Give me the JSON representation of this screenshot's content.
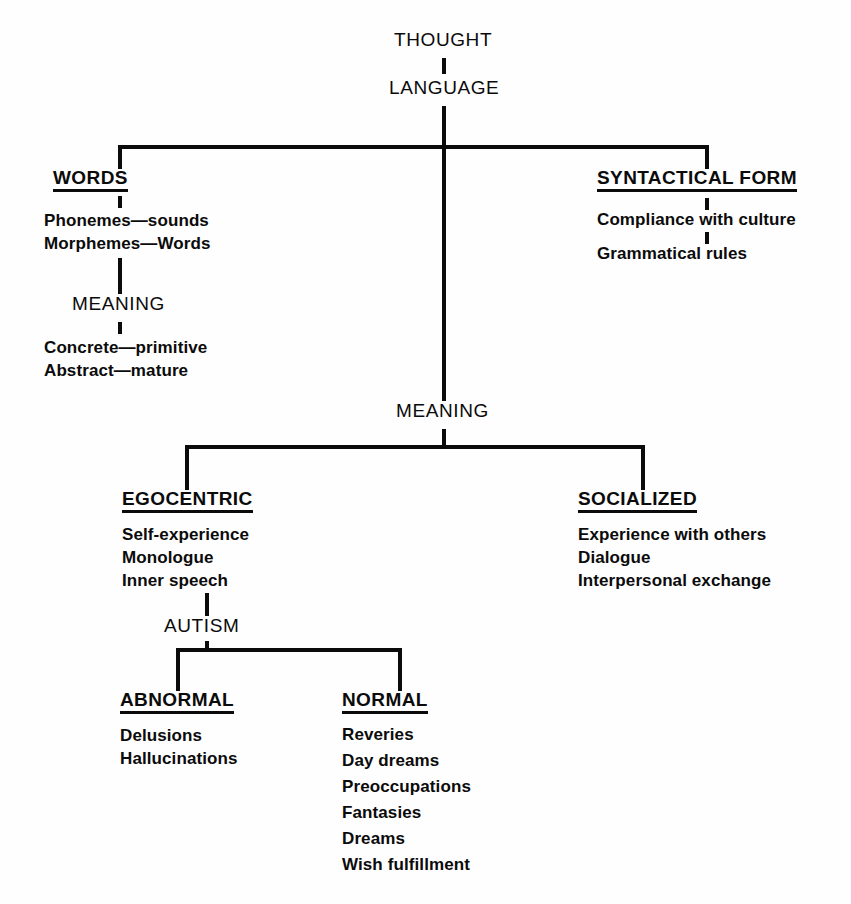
{
  "diagram": {
    "title": "THOUGHT",
    "subtitle": "LANGUAGE",
    "root": {
      "label": "THOUGHT"
    },
    "level1": {
      "label": "LANGUAGE"
    },
    "branches": {
      "words": {
        "label": "WORDS",
        "items": [
          "Phonemes—sounds",
          "Morphemes—Words"
        ],
        "child": {
          "label": "MEANING",
          "items": [
            "Concrete—primitive",
            "Abstract—mature"
          ]
        }
      },
      "syntactical_form": {
        "label": "SYNTACTICAL FORM",
        "items": [
          "Compliance with culture",
          "Grammatical rules"
        ]
      },
      "meaning": {
        "label": "MEANING",
        "children": {
          "egocentric": {
            "label": "EGOCENTRIC",
            "items": [
              "Self-experience",
              "Monologue",
              "Inner speech"
            ],
            "child": {
              "label": "AUTISM",
              "children": {
                "abnormal": {
                  "label": "ABNORMAL",
                  "items": [
                    "Delusions",
                    "Hallucinations"
                  ]
                },
                "normal": {
                  "label": "NORMAL",
                  "items": [
                    "Reveries",
                    "Day dreams",
                    "Preoccupations",
                    "Fantasies",
                    "Dreams",
                    "Wish fulfillment"
                  ]
                }
              }
            }
          },
          "socialized": {
            "label": "SOCIALIZED",
            "items": [
              "Experience with others",
              "Dialogue",
              "Interpersonal exchange"
            ]
          }
        }
      }
    },
    "colors": {
      "ink": "#0b0b0b",
      "paper": "#fefefe"
    }
  }
}
